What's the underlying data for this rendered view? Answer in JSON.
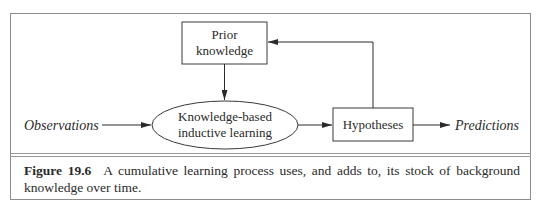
{
  "diagram": {
    "nodes": {
      "prior_knowledge": {
        "line1": "Prior",
        "line2": "knowledge",
        "shape": "rectangle"
      },
      "learning": {
        "line1": "Knowledge-based",
        "line2": "inductive learning",
        "shape": "ellipse"
      },
      "hypotheses": {
        "label": "Hypotheses",
        "shape": "rectangle"
      }
    },
    "inputs": {
      "observations": "Observations"
    },
    "outputs": {
      "predictions": "Predictions"
    },
    "edges": [
      {
        "from": "Observations",
        "to": "Knowledge-based inductive learning"
      },
      {
        "from": "Prior knowledge",
        "to": "Knowledge-based inductive learning"
      },
      {
        "from": "Knowledge-based inductive learning",
        "to": "Hypotheses"
      },
      {
        "from": "Hypotheses",
        "to": "Predictions"
      },
      {
        "from": "Hypotheses",
        "to": "Prior knowledge"
      }
    ]
  },
  "caption": {
    "figure_label": "Figure 19.6",
    "text": "A cumulative learning process uses, and adds to, its stock of background knowledge over time."
  }
}
